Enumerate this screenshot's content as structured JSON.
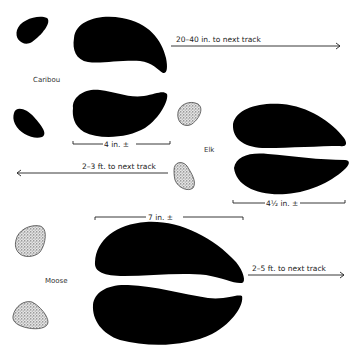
{
  "diagram": {
    "type": "animal track comparison",
    "animals": [
      {
        "name": "Caribou",
        "size_label": "4 in. ±",
        "stride_label": "20–40 in. to next track"
      },
      {
        "name": "Elk",
        "size_label": "4½ in. ±",
        "stride_label": "2–3 ft. to next track"
      },
      {
        "name": "Moose",
        "size_label": "7 in. ±",
        "stride_label": "2–5 ft. to next track"
      }
    ]
  }
}
